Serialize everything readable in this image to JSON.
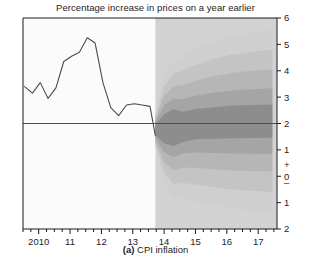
{
  "chart_data": {
    "type": "area",
    "title": "Percentage increase in prices on a year earlier",
    "caption_prefix": "(a)",
    "caption_text": "CPI inflation",
    "xlabel": "",
    "ylabel": "",
    "grid": false,
    "legend": false,
    "xlim": [
      2009.5,
      2017.6
    ],
    "ylim": [
      -2,
      6
    ],
    "y_ticks": [
      6,
      5,
      4,
      3,
      2,
      1,
      0,
      -1,
      -2
    ],
    "y_tick_labels": [
      "6",
      "5",
      "4",
      "3",
      "2",
      "1",
      "0",
      "1",
      "2"
    ],
    "y_sign_plus": "+",
    "y_sign_minus": "–",
    "x_ticks": [
      2010,
      2011,
      2012,
      2013,
      2014,
      2015,
      2016,
      2017
    ],
    "x_tick_labels": [
      "2010",
      "11",
      "12",
      "13",
      "14",
      "15",
      "16",
      "17"
    ],
    "x_minor_interval_years": 0.25,
    "target_line_value": 2,
    "forecast_start": 2013.72,
    "colors": {
      "history_line": "#4c4c4c",
      "target_line": "#4c4c4c",
      "forecast_background": "#d2d2d2",
      "band_1": "#8d8d8d",
      "band_2": "#a5a5a5",
      "band_3": "#b6b6b6",
      "band_4": "#c4c4c4",
      "band_5": "#cfcfcf",
      "axis": "#1a1a1a",
      "plot_background": "#fbfbfb"
    },
    "history": {
      "name": "CPI inflation (outturn)",
      "x": [
        2009.55,
        2009.8,
        2010.05,
        2010.3,
        2010.55,
        2010.8,
        2011.05,
        2011.3,
        2011.55,
        2011.8,
        2012.05,
        2012.3,
        2012.55,
        2012.8,
        2013.05,
        2013.3,
        2013.55,
        2013.72
      ],
      "values": [
        3.4,
        3.15,
        3.55,
        2.95,
        3.35,
        4.35,
        4.55,
        4.7,
        5.25,
        5.05,
        3.55,
        2.6,
        2.3,
        2.7,
        2.75,
        2.7,
        2.65,
        1.55
      ]
    },
    "fan_bands": [
      {
        "name": "30% probability band",
        "color": "#8d8d8d",
        "x": [
          2013.72,
          2014.0,
          2014.3,
          2014.6,
          2015.0,
          2015.6,
          2016.2,
          2016.8,
          2017.45
        ],
        "upper": [
          1.95,
          2.35,
          2.55,
          2.45,
          2.55,
          2.62,
          2.68,
          2.7,
          2.72
        ],
        "lower": [
          1.55,
          1.25,
          1.15,
          1.3,
          1.4,
          1.42,
          1.44,
          1.45,
          1.46
        ]
      },
      {
        "name": "50% probability band",
        "color": "#a5a5a5",
        "x": [
          2013.72,
          2014.0,
          2014.3,
          2014.6,
          2015.0,
          2015.6,
          2016.2,
          2016.8,
          2017.45
        ],
        "upper": [
          2.05,
          2.7,
          2.95,
          2.92,
          3.05,
          3.18,
          3.25,
          3.3,
          3.34
        ],
        "lower": [
          1.45,
          0.92,
          0.72,
          0.86,
          0.9,
          0.88,
          0.86,
          0.85,
          0.84
        ]
      },
      {
        "name": "70% probability band",
        "color": "#b6b6b6",
        "x": [
          2013.72,
          2014.0,
          2014.3,
          2014.6,
          2015.0,
          2015.6,
          2016.2,
          2016.8,
          2017.45
        ],
        "upper": [
          2.15,
          3.05,
          3.4,
          3.45,
          3.62,
          3.8,
          3.92,
          4.0,
          4.05
        ],
        "lower": [
          1.35,
          0.55,
          0.22,
          0.32,
          0.32,
          0.26,
          0.22,
          0.2,
          0.18
        ]
      },
      {
        "name": "85% probability band",
        "color": "#c4c4c4",
        "x": [
          2013.72,
          2014.0,
          2014.3,
          2014.6,
          2015.0,
          2015.6,
          2016.2,
          2016.8,
          2017.45
        ],
        "upper": [
          2.25,
          3.42,
          3.88,
          4.0,
          4.22,
          4.46,
          4.62,
          4.72,
          4.8
        ],
        "lower": [
          1.25,
          0.18,
          -0.3,
          -0.25,
          -0.32,
          -0.42,
          -0.5,
          -0.55,
          -0.6
        ]
      },
      {
        "name": "90% probability band",
        "color": "#cfcfcf",
        "x": [
          2013.72,
          2014.0,
          2014.3,
          2014.6,
          2015.0,
          2015.6,
          2016.2,
          2016.8,
          2017.45
        ],
        "upper": [
          2.35,
          3.8,
          4.35,
          4.55,
          4.85,
          5.12,
          5.32,
          5.45,
          5.55
        ],
        "lower": [
          1.15,
          -0.2,
          -0.82,
          -0.82,
          -0.95,
          -1.1,
          -1.22,
          -1.3,
          -1.38
        ]
      }
    ]
  }
}
